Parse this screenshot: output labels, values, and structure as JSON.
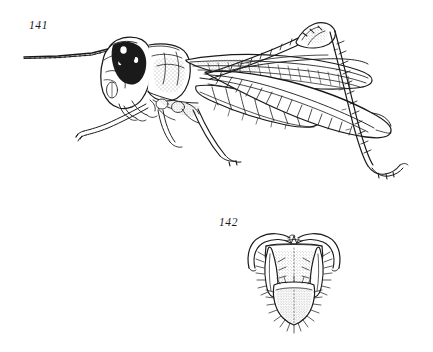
{
  "plate": {
    "background_color": "#ffffff",
    "ink_color": "#1a1a1a",
    "width": 433,
    "height": 352,
    "type": "scientific-illustration-plate",
    "subject": "grasshopper (Orthoptera: Acrididae) line drawings"
  },
  "figures": [
    {
      "number": "141",
      "label": "141",
      "view": "lateral habitus",
      "description": "Whole grasshopper in left lateral view with long filiform antenna, dark head markings, pronotum, folded tegmen with venation, segmented abdomen, enlarged hind femur and spined hind tibia with tarsus",
      "label_position": {
        "x": 29,
        "y": 19
      },
      "parts": [
        "antenna",
        "head",
        "compound-eye",
        "pronotum",
        "tegmen",
        "abdomen",
        "fore-leg",
        "mid-leg",
        "hind-femur",
        "hind-tibia",
        "hind-tarsus"
      ]
    },
    {
      "number": "142",
      "label": "142",
      "view": "dorsal view of male abdominal terminalia",
      "description": "Supra-anal plate with furcula, paired cerci bearing setae, and hairy subgenital plate below",
      "label_position": {
        "x": 219,
        "y": 216
      },
      "parts": [
        "furcula",
        "supra-anal-plate",
        "cercus-left",
        "cercus-right",
        "subgenital-plate",
        "setae"
      ]
    }
  ]
}
